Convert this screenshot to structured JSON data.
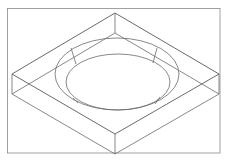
{
  "figure": {
    "title": "",
    "colors": {
      "background": "#ffffff",
      "frame": "#8a8a8a",
      "line": "#6a6a6a"
    },
    "frame": {
      "x": 7,
      "y": 8,
      "width": 213,
      "height": 145
    },
    "block": {
      "top_face": {
        "top": [
          115,
          13
        ],
        "right": [
          219,
          74
        ],
        "bottom": [
          115,
          134
        ],
        "left": [
          12,
          74
        ]
      },
      "depth": 20
    },
    "recess": {
      "outer_ellipse": {
        "cx": 117,
        "cy": 74,
        "rx": 62,
        "ry": 36
      },
      "inner_ellipse": {
        "cx": 118,
        "cy": 82,
        "rx": 52,
        "ry": 28
      },
      "wall_ticks": [
        {
          "x1": 71,
          "y1": 48,
          "x2": 76,
          "y2": 64
        },
        {
          "x1": 157,
          "y1": 48,
          "x2": 153,
          "y2": 63
        },
        {
          "x1": 73,
          "y1": 98,
          "x2": 78,
          "y2": 103
        },
        {
          "x1": 160,
          "y1": 97,
          "x2": 155,
          "y2": 104
        }
      ]
    }
  }
}
